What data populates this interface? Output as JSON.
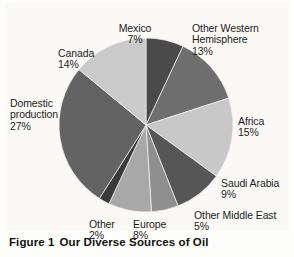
{
  "figure": {
    "caption_number": "Figure 1",
    "caption_title": "Our Diverse Sources of Oil"
  },
  "chart_data": {
    "type": "pie",
    "title": "Our Diverse Sources of Oil",
    "xlabel": "",
    "ylabel": "",
    "legend_position": "none",
    "grid": false,
    "units": "percent",
    "start_angle_deg": 0,
    "direction": "clockwise",
    "center": {
      "x": 146,
      "y": 125
    },
    "radius": 87,
    "categories": [
      "Mexico",
      "Other Western Hemisphere",
      "Africa",
      "Saudi Arabia",
      "Other Middle East",
      "Europe",
      "Other",
      "Domestic production",
      "Canada"
    ],
    "values": [
      7,
      13,
      15,
      9,
      5,
      8,
      2,
      27,
      14
    ],
    "slices": [
      {
        "label": "Mexico",
        "value": 7,
        "pct_text": "7%",
        "color": "#4a4a4a"
      },
      {
        "label": "Other Western Hemisphere",
        "value": 13,
        "pct_text": "13%",
        "color": "#6e6e6e"
      },
      {
        "label": "Africa",
        "value": 15,
        "pct_text": "15%",
        "color": "#c8c8c8"
      },
      {
        "label": "Saudi Arabia",
        "value": 9,
        "pct_text": "9%",
        "color": "#565656"
      },
      {
        "label": "Other Middle East",
        "value": 5,
        "pct_text": "5%",
        "color": "#8f8f8f"
      },
      {
        "label": "Europe",
        "value": 8,
        "pct_text": "8%",
        "color": "#a8a8a8"
      },
      {
        "label": "Other",
        "value": 2,
        "pct_text": "2%",
        "color": "#3a3a3a"
      },
      {
        "label": "Domestic production",
        "value": 27,
        "pct_text": "27%",
        "color": "#636363"
      },
      {
        "label": "Canada",
        "value": 14,
        "pct_text": "14%",
        "color": "#cacaca"
      }
    ]
  },
  "labels": {
    "mexico": {
      "name": "Mexico",
      "pct": "7%"
    },
    "owh": {
      "name": "Other Western\nHemisphere",
      "pct": "13%"
    },
    "canada": {
      "name": "Canada",
      "pct": "14%"
    },
    "domestic": {
      "name": "Domestic\nproduction",
      "pct": "27%"
    },
    "africa": {
      "name": "Africa",
      "pct": "15%"
    },
    "saudi": {
      "name": "Saudi Arabia",
      "pct": "9%"
    },
    "ome": {
      "name": "Other Middle East",
      "pct": "5%"
    },
    "europe": {
      "name": "Europe",
      "pct": "8%"
    },
    "other": {
      "name": "Other",
      "pct": "2%"
    }
  },
  "colors": {
    "background": "#fdfdfb",
    "plate": "#faf9f6",
    "text": "#1d1d1d",
    "caption": "#111111"
  }
}
